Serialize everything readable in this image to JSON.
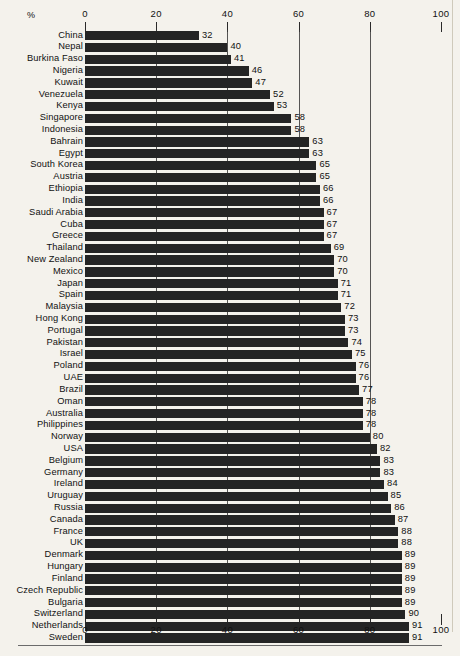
{
  "chart_data": {
    "type": "bar",
    "orientation": "horizontal",
    "title": "",
    "subtitle": "",
    "xlabel": "%",
    "ylabel": "",
    "xlim": [
      0,
      100
    ],
    "grid": true,
    "legend": null,
    "axis_unit_label": "%",
    "tick_labels": [
      "0",
      "20",
      "40",
      "60",
      "80",
      "100"
    ],
    "tick_values": [
      0,
      20,
      40,
      60,
      80,
      100
    ],
    "top_axis": true,
    "bottom_axis": true,
    "data_labels_shown": true,
    "categories": [
      "China",
      "Nepal",
      "Burkina Faso",
      "Nigeria",
      "Kuwait",
      "Venezuela",
      "Kenya",
      "Singapore",
      "Indonesia",
      "Bahrain",
      "Egypt",
      "South Korea",
      "Austria",
      "Ethiopia",
      "India",
      "Saudi Arabia",
      "Cuba",
      "Greece",
      "Thailand",
      "New Zealand",
      "Mexico",
      "Japan",
      "Spain",
      "Malaysia",
      "Hong Kong",
      "Portugal",
      "Pakistan",
      "Israel",
      "Poland",
      "UAE",
      "Brazil",
      "Oman",
      "Australia",
      "Philippines",
      "Norway",
      "USA",
      "Belgium",
      "Germany",
      "Ireland",
      "Uruguay",
      "Russia",
      "Canada",
      "France",
      "UK",
      "Denmark",
      "Hungary",
      "Finland",
      "Czech Republic",
      "Bulgaria",
      "Switzerland",
      "Netherlands",
      "Sweden"
    ],
    "values": [
      32,
      40,
      41,
      46,
      47,
      52,
      53,
      58,
      58,
      63,
      63,
      65,
      65,
      66,
      66,
      67,
      67,
      67,
      69,
      70,
      70,
      71,
      71,
      72,
      73,
      73,
      74,
      75,
      76,
      76,
      77,
      78,
      78,
      78,
      80,
      82,
      83,
      83,
      84,
      85,
      86,
      87,
      88,
      88,
      89,
      89,
      89,
      89,
      89,
      90,
      91,
      91
    ],
    "value_labels": [
      "32",
      "40",
      "41",
      "46",
      "47",
      "52",
      "53",
      "58",
      "58",
      "63",
      "63",
      "65",
      "65",
      "66",
      "66",
      "67",
      "67",
      "67",
      "69",
      "70",
      "70",
      "71",
      "71",
      "72",
      "73",
      "73",
      "74",
      "75",
      "76",
      "76",
      "77",
      "78",
      "78",
      "78",
      "80",
      "82",
      "83",
      "83",
      "84",
      "85",
      "86",
      "87",
      "88",
      "88",
      "89",
      "89",
      "89",
      "89",
      "89",
      "90",
      "91",
      "91"
    ],
    "bar_color": "#242424",
    "background_color": "#f4f2ec",
    "text_color": "#111111"
  }
}
